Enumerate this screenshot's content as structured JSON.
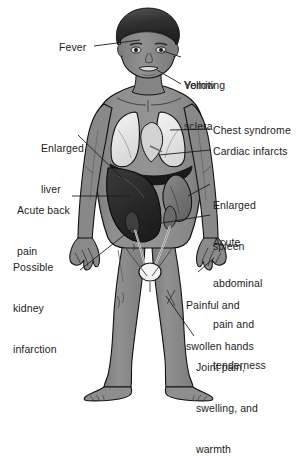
{
  "diagram": {
    "type": "anatomical-illustration",
    "background_color": "#ffffff",
    "style": "grayscale line drawing with shading",
    "colors": {
      "skin": "#8c8c8c",
      "skin_shadow": "#6f6f6f",
      "hair_dark": "#2a2a2a",
      "hair_light": "#6a6a6a",
      "lung": "#ebebeb",
      "liver": "#2b2b2b",
      "spleen": "#7a7a7a",
      "bladder": "#f2f2f2",
      "outline": "#111111",
      "leader_line": "#1c1c1c",
      "text": "#1c1c1c"
    }
  },
  "labels": [
    {
      "id": "fever",
      "text": "Fever",
      "side": "left",
      "x": 59,
      "y": 41,
      "lines": [
        "Fever"
      ]
    },
    {
      "id": "yellow-sclera",
      "text": "Yellow sclera",
      "side": "right",
      "x": 184,
      "y": 52,
      "lines": [
        "Yellow",
        "sclera"
      ]
    },
    {
      "id": "vomiting",
      "text": "Vomiting",
      "side": "right",
      "x": 184,
      "y": 79,
      "lines": [
        "Vomiting"
      ]
    },
    {
      "id": "enlarged-liver",
      "text": "Enlarged liver",
      "side": "left",
      "x": 41,
      "y": 115,
      "lines": [
        "Enlarged",
        "liver"
      ]
    },
    {
      "id": "chest-syndrome",
      "text": "Chest syndrome",
      "side": "right",
      "x": 213,
      "y": 124,
      "lines": [
        "Chest syndrome"
      ]
    },
    {
      "id": "cardiac-infarcts",
      "text": "Cardiac infarcts",
      "side": "right",
      "x": 213,
      "y": 145,
      "lines": [
        "Cardiac infarcts"
      ]
    },
    {
      "id": "enlarged-spleen",
      "text": "Enlarged spleen",
      "side": "right",
      "x": 213,
      "y": 172,
      "lines": [
        "Enlarged",
        "spleen"
      ]
    },
    {
      "id": "acute-back-pain",
      "text": "Acute back pain",
      "side": "left",
      "x": 17,
      "y": 177,
      "lines": [
        "Acute back",
        "pain"
      ]
    },
    {
      "id": "acute-abdominal",
      "text": "Acute abdominal pain and tenderness",
      "side": "right",
      "x": 213,
      "y": 209,
      "lines": [
        "Acute",
        "abdominal",
        "pain and",
        "tenderness"
      ]
    },
    {
      "id": "kidney-infarction",
      "text": "Possible kidney infarction",
      "side": "left",
      "x": 13,
      "y": 234,
      "lines": [
        "Possible",
        "kidney",
        "infarction"
      ]
    },
    {
      "id": "swollen-hands",
      "text": "Painful and swollen hands",
      "side": "right",
      "x": 186,
      "y": 272,
      "lines": [
        "Painful and",
        "swollen hands"
      ]
    },
    {
      "id": "joint-pain",
      "text": "Joint pain, swelling, and warmth",
      "side": "right",
      "x": 196,
      "y": 334,
      "lines": [
        "Joint pain,",
        "swelling, and",
        "warmth"
      ]
    }
  ]
}
